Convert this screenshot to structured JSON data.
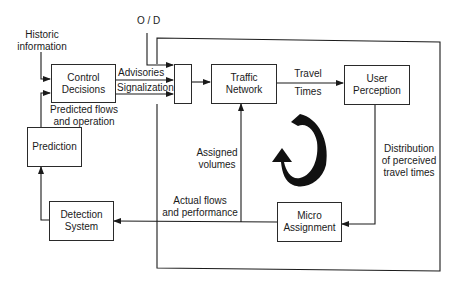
{
  "diagram": {
    "nodes": {
      "control_decisions": {
        "line1": "Control",
        "line2": "Decisions"
      },
      "junction": {
        "label": ""
      },
      "traffic_network": {
        "line1": "Traffic",
        "line2": "Network"
      },
      "user_perception": {
        "line1": "User",
        "line2": "Perception"
      },
      "prediction": {
        "line1": "Prediction"
      },
      "detection_system": {
        "line1": "Detection",
        "line2": "System"
      },
      "micro_assignment": {
        "line1": "Micro",
        "line2": "Assignment"
      }
    },
    "labels": {
      "historic_information": {
        "line1": "Historic",
        "line2": "information"
      },
      "od": "O / D",
      "advisories": "Advisories",
      "signalization": "Signalization",
      "predicted_flows": {
        "line1": "Predicted flows",
        "line2": "and operation"
      },
      "travel_times": {
        "line1": "Travel",
        "line2": "Times"
      },
      "assigned_volumes": {
        "line1": "Assigned",
        "line2": "volumes"
      },
      "distribution": {
        "line1": "Distribution",
        "line2": "of perceived",
        "line3": "travel times"
      },
      "actual_flows": {
        "line1": "Actual flows",
        "line2": "and performance"
      }
    },
    "edges": [
      {
        "from": "historic_information",
        "to": "control_decisions"
      },
      {
        "from": "prediction",
        "to": "control_decisions",
        "label": "Predicted flows and operation"
      },
      {
        "from": "od",
        "to": "junction"
      },
      {
        "from": "control_decisions",
        "to": "junction",
        "label": "Advisories"
      },
      {
        "from": "control_decisions",
        "to": "junction",
        "label": "Signalization"
      },
      {
        "from": "junction",
        "to": "traffic_network"
      },
      {
        "from": "traffic_network",
        "to": "user_perception",
        "label": "Travel Times"
      },
      {
        "from": "user_perception",
        "to": "micro_assignment",
        "label": "Distribution of perceived travel times"
      },
      {
        "from": "micro_assignment",
        "to": "traffic_network",
        "label": "Assigned volumes"
      },
      {
        "from": "micro_assignment",
        "to": "detection_system",
        "label": "Actual flows and performance"
      },
      {
        "from": "detection_system",
        "to": "prediction"
      }
    ],
    "colors": {
      "line": "#1a1a1a",
      "background": "#ffffff"
    }
  }
}
